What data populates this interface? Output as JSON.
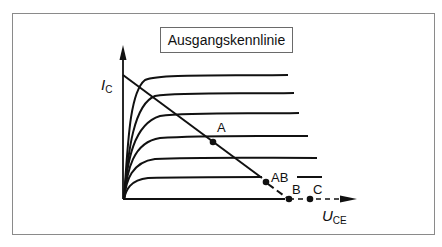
{
  "title": "Ausgangskennlinie",
  "axes": {
    "y_label_main": "I",
    "y_label_sub": "C",
    "x_label_main": "U",
    "x_label_sub": "CE"
  },
  "points": [
    {
      "id": "A",
      "label": "A"
    },
    {
      "id": "AB",
      "label": "AB"
    },
    {
      "id": "B",
      "label": "B"
    },
    {
      "id": "C",
      "label": "C"
    }
  ],
  "colors": {
    "line": "#111111",
    "frame": "#8a8a8a",
    "background": "#ffffff"
  }
}
